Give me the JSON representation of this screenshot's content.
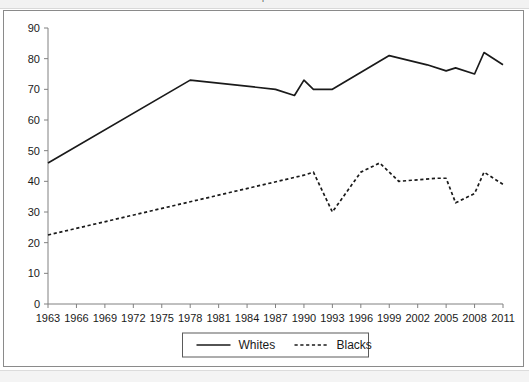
{
  "figure": {
    "clipped_title_fragment": "p",
    "background_color": "#ffffff",
    "frame_color": "#8a8a8a"
  },
  "chart_data": {
    "type": "line",
    "title": "",
    "subtitle": "",
    "xlabel": "",
    "ylabel": "",
    "xlim": [
      1963,
      2011
    ],
    "ylim": [
      0,
      90
    ],
    "ytick_step": 10,
    "xtick_step": 3,
    "grid": false,
    "legend_position": "bottom-center",
    "yticks": [
      0,
      10,
      20,
      30,
      40,
      50,
      60,
      70,
      80,
      90
    ],
    "xticks": [
      1963,
      1966,
      1969,
      1972,
      1975,
      1978,
      1981,
      1984,
      1987,
      1990,
      1993,
      1996,
      1999,
      2002,
      2005,
      2008,
      2011
    ],
    "x": [
      1963,
      1978,
      1987,
      1990,
      1991,
      1993,
      1999,
      2002,
      2005,
      2006,
      2008,
      2009,
      2011
    ],
    "series": [
      {
        "name": "Whites",
        "style": "solid",
        "color": "#1a1a1a",
        "x": [
          1963,
          1978,
          1987,
          1989,
          1990,
          1991,
          1993,
          1999,
          2003,
          2005,
          2006,
          2008,
          2009,
          2011
        ],
        "values": [
          46,
          73,
          70,
          68,
          73,
          70,
          70,
          81,
          78,
          76,
          77,
          75,
          82,
          78
        ]
      },
      {
        "name": "Blacks",
        "style": "dashed",
        "color": "#1a1a1a",
        "x": [
          1963,
          1990,
          1991,
          1993,
          1996,
          1998,
          2000,
          2004,
          2005,
          2006,
          2008,
          2009,
          2011
        ],
        "values": [
          22.5,
          42,
          43,
          30,
          43,
          46,
          40,
          41,
          41,
          33,
          36,
          43,
          39
        ]
      }
    ],
    "legend": [
      {
        "label": "Whites",
        "style": "solid"
      },
      {
        "label": "Blacks",
        "style": "dashed"
      }
    ]
  }
}
